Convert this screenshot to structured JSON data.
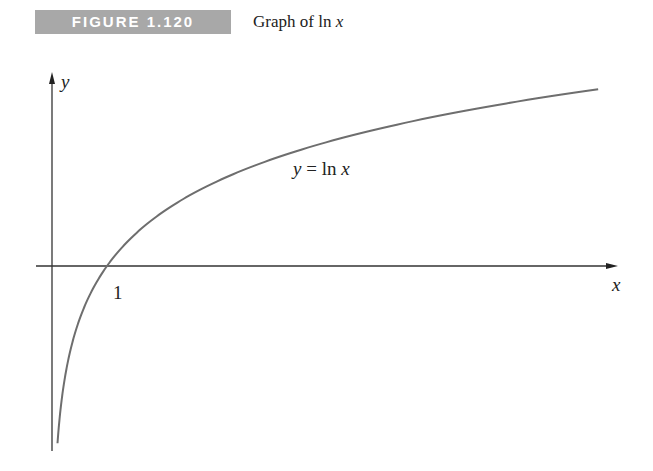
{
  "figure": {
    "number_label": "FIGURE 1.120",
    "caption_prefix": "Graph of ",
    "caption_func": "ln",
    "caption_var": "x"
  },
  "chart_data": {
    "type": "line",
    "title": "Graph of ln x",
    "xlabel": "x",
    "ylabel": "y",
    "x_ticks": [
      {
        "value": 1,
        "label": "1"
      }
    ],
    "y_ticks": [],
    "grid": false,
    "legend": null,
    "annotations": [
      {
        "text": "y = ln x",
        "near_x": 5.0,
        "near_y": 1.4
      }
    ],
    "xlim": [
      -0.25,
      10.9
    ],
    "ylim": [
      -2.5,
      2.5
    ],
    "series": [
      {
        "name": "y = ln x",
        "x": [
          0.1,
          0.15,
          0.2,
          0.3,
          0.4,
          0.5,
          0.7,
          1,
          1.5,
          2,
          3,
          4,
          5,
          6,
          7,
          8,
          9,
          9.93
        ],
        "values": [
          -2.303,
          -1.897,
          -1.609,
          -1.204,
          -0.916,
          -0.693,
          -0.357,
          0,
          0.405,
          0.693,
          1.099,
          1.386,
          1.609,
          1.792,
          1.946,
          2.079,
          2.197,
          2.296
        ]
      }
    ],
    "colors": {
      "axis": "#333333",
      "curve": "#6e6e6e"
    }
  },
  "plot_labels": {
    "y_axis": "y",
    "x_axis": "x",
    "tick_one": "1",
    "curve_y": "y",
    "curve_eq": " = ln ",
    "curve_x": "x"
  }
}
